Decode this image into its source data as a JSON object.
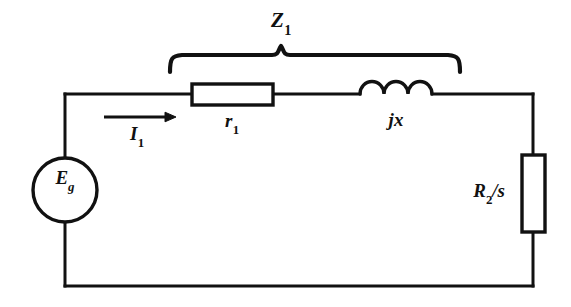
{
  "figure": {
    "kind": "circuit-diagram",
    "title_visible": false,
    "background_color": "#ffffff",
    "line_color": "#111111",
    "canvas": {
      "width": 571,
      "height": 307
    }
  },
  "labels": {
    "impedance_group": {
      "base": "Z",
      "subscript": "1",
      "text": "Z1"
    },
    "series_resistor": {
      "base": "r",
      "subscript": "1",
      "text": "r1"
    },
    "series_reactance": {
      "base": "jx",
      "subscript": "",
      "text": "jx"
    },
    "current": {
      "base": "I",
      "subscript": "1",
      "text": "I1"
    },
    "source": {
      "base": "E",
      "subscript": "g",
      "text": "Eg"
    },
    "rotor_resistance": {
      "base": "R",
      "subscript": "2",
      "suffix": "/s",
      "text": "R2/s"
    }
  },
  "components": {
    "source": {
      "name": "voltage-source",
      "shape": "circle",
      "center_x": 65,
      "center_y": 190,
      "radius": 32
    },
    "series_resistor": {
      "name": "resistor-r1",
      "shape": "rectangle",
      "x": 192,
      "y": 84,
      "width": 81,
      "height": 21
    },
    "inductor": {
      "name": "inductor-jx",
      "shape": "coils",
      "start_x": 360,
      "end_x": 432,
      "baseline_y": 94,
      "coil_count": 3
    },
    "load_resistor": {
      "name": "resistor-r2-over-s",
      "shape": "rectangle",
      "x": 522,
      "y": 155,
      "width": 23,
      "height": 77
    },
    "current_arrow": {
      "name": "current-arrow-i1",
      "start_x": 104,
      "end_x": 176,
      "y": 117,
      "direction": "right"
    },
    "brace": {
      "name": "impedance-brace",
      "left_x": 170,
      "right_x": 460,
      "tip_x": 281,
      "top_y": 53,
      "bottom_y": 72
    }
  },
  "wires": {
    "left_x": 65,
    "right_x": 533,
    "top_y": 94,
    "bottom_y": 286
  }
}
